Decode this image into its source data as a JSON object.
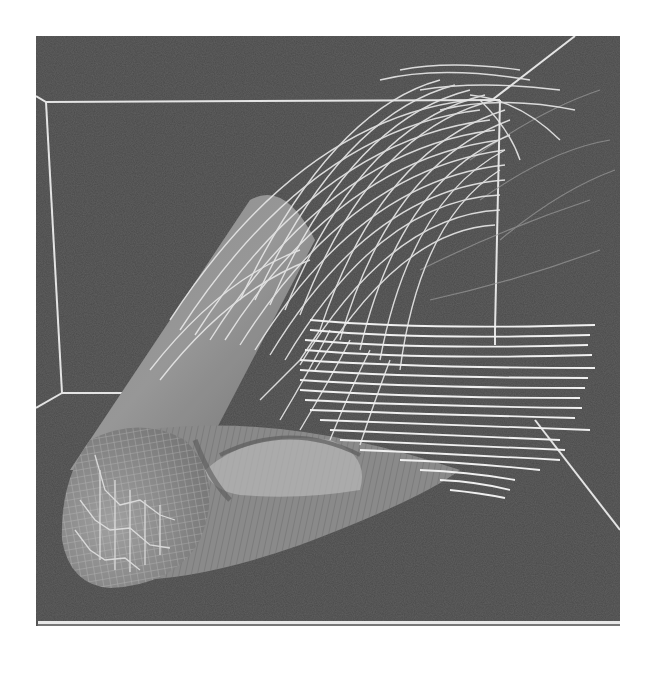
{
  "figure": {
    "kind": "3d-flow-visualization",
    "colors": {
      "page_background": "#ffffff",
      "panel_background": "#4a4a4a",
      "box_edges": "#e6e6e6",
      "cylinder_surface": "#8f8f8f",
      "cylinder_highlight": "#a8a8a8",
      "streamlines": "#e8e8e8",
      "mesh_lines": "#d8d8d8"
    },
    "panel": {
      "x": 36,
      "y": 36,
      "width": 584,
      "height": 590
    },
    "elements": [
      "bounding-box-wireframe",
      "cylinder-body",
      "hemispherical-nose-cap-mesh",
      "upper-streamline-bundle",
      "lower-horizontal-streamline-bundle",
      "wake-separation-region"
    ]
  }
}
